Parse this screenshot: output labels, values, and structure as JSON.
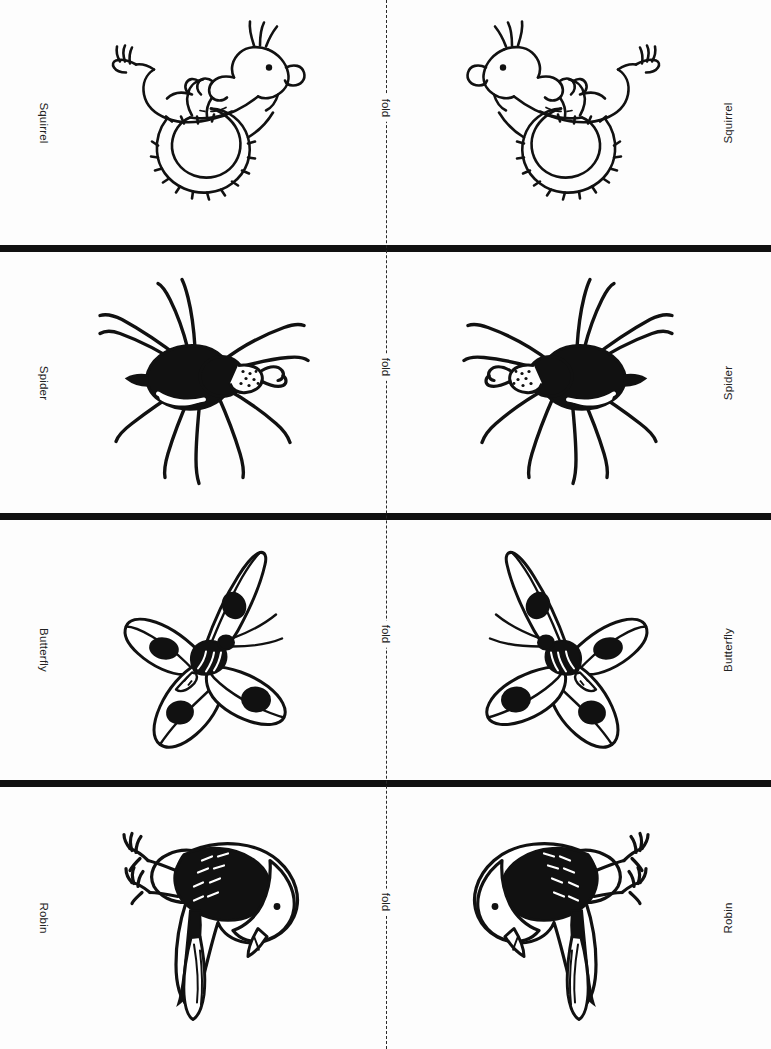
{
  "page": {
    "background_color": "#fdfdfd",
    "ink_color": "#111111",
    "separator_color": "#111111",
    "fold_label": "fold"
  },
  "fold": {
    "label": "fold",
    "orientation": "vertical-center",
    "style": "dashed"
  },
  "panels": [
    {
      "index": 1,
      "animal": "Squirrel",
      "left_label": "Squirrel",
      "right_label": "Squirrel",
      "fold_label": "fold",
      "icon": "squirrel-line-art"
    },
    {
      "index": 2,
      "animal": "Spider",
      "left_label": "Spider",
      "right_label": "Spider",
      "fold_label": "fold",
      "icon": "spider-line-art"
    },
    {
      "index": 3,
      "animal": "Butterfly",
      "left_label": "Butterfly",
      "right_label": "Butterfly",
      "fold_label": "fold",
      "icon": "butterfly-line-art"
    },
    {
      "index": 4,
      "animal": "Robin",
      "left_label": "Robin",
      "right_label": "Robin",
      "fold_label": "fold",
      "icon": "robin-line-art"
    }
  ],
  "separators": {
    "count": 3,
    "color": "#111111"
  }
}
